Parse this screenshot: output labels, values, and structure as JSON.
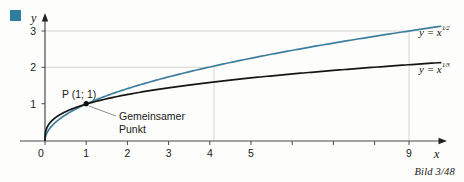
{
  "figure": {
    "caption": "Bild 3/48",
    "bullet_color": "#2e7d9e"
  },
  "chart_data": {
    "type": "line",
    "title": "",
    "xlabel": "x",
    "ylabel": "y",
    "xlim": [
      0,
      9.8
    ],
    "ylim": [
      0,
      3.35
    ],
    "grid": "partial",
    "x_ticks": [
      0,
      1,
      2,
      3,
      4,
      5,
      6,
      7,
      8,
      9
    ],
    "x_tick_labels": [
      "0",
      "1",
      "2",
      "3",
      "4",
      "5",
      "",
      "",
      "",
      "9"
    ],
    "y_ticks": [
      1,
      2,
      3
    ],
    "y_tick_labels": [
      "1",
      "2",
      "3"
    ],
    "series": [
      {
        "name": "y = x^(1/2)",
        "label_base": "y = x",
        "label_exponent_num": "1",
        "label_exponent_den": "2",
        "color": "#3f7f9e",
        "exponent": 0.5,
        "x": [
          0,
          0.25,
          0.5,
          1,
          2,
          3,
          4,
          5,
          6,
          7,
          8,
          9,
          9.6
        ],
        "y": [
          0,
          0.5,
          0.707,
          1,
          1.414,
          1.732,
          2,
          2.236,
          2.449,
          2.646,
          2.828,
          3,
          3.098
        ]
      },
      {
        "name": "y = x^(1/3)",
        "label_base": "y = x",
        "label_exponent_num": "1",
        "label_exponent_den": "3",
        "color": "#161616",
        "exponent": 0.3333,
        "x": [
          0,
          0.25,
          0.5,
          1,
          2,
          3,
          4,
          5,
          6,
          7,
          8,
          9,
          9.6
        ],
        "y": [
          0,
          0.63,
          0.794,
          1,
          1.26,
          1.442,
          1.587,
          1.71,
          1.817,
          1.913,
          2.0,
          2.08,
          2.126
        ]
      }
    ],
    "annotations": [
      {
        "name": "common-point",
        "point_label": "P (1; 1)",
        "note": "Gemeinsamer",
        "note_line2": "Punkt",
        "x": 1,
        "y": 1
      }
    ],
    "guide_lines": [
      {
        "name": "guide-x4-y2",
        "x": 4,
        "y": 2
      },
      {
        "name": "guide-x9-y3",
        "x": 9,
        "y": 3
      }
    ]
  }
}
